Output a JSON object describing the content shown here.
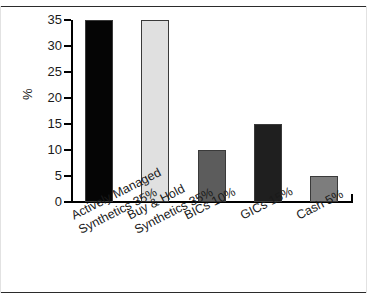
{
  "chart_data": {
    "type": "bar",
    "title": "",
    "xlabel": "",
    "ylabel": "%",
    "ylim": [
      0,
      35
    ],
    "yticks": [
      0,
      5,
      10,
      15,
      20,
      25,
      30,
      35
    ],
    "ytick_labels": [
      "0",
      "5",
      "10",
      "15",
      "20",
      "25",
      "30",
      "35"
    ],
    "grid": false,
    "legend": "none",
    "categories": [
      "Actively Managed Synthetics 35%",
      "Buy & Hold Synthetics 35%",
      "BICs 10%",
      "GICs 15%",
      "Cash 5%"
    ],
    "category_lines": [
      [
        "Actively Managed",
        "Synthetics 35%"
      ],
      [
        "Buy & Hold",
        "Synthetics 35%"
      ],
      [
        "BICs 10%"
      ],
      [
        "GICs 15%"
      ],
      [
        "Cash 5%"
      ]
    ],
    "values": [
      35,
      35,
      10,
      15,
      5
    ],
    "bar_colors": [
      "#050505",
      "#e0e0e0",
      "#5c5c5c",
      "#1f1f1f",
      "#7d7d7d"
    ],
    "bar_edge_color": "#3a3a3a"
  },
  "figure": {
    "background": "#ffffff",
    "frame_color": "#2b2b2b",
    "axis_color": "#000000",
    "text_color": "#1a1a1a"
  }
}
